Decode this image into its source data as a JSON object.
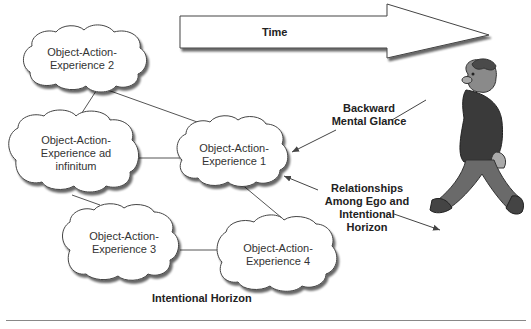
{
  "diagram": {
    "time_arrow": {
      "label": "Time"
    },
    "clouds": [
      {
        "id": "oae2",
        "line1": "Object-Action-",
        "line2": "Experience 2"
      },
      {
        "id": "oae-inf",
        "line1": "Object-Action-",
        "line2": "Experience ad",
        "line3": "infinitum"
      },
      {
        "id": "oae1",
        "line1": "Object-Action-",
        "line2": "Experience 1"
      },
      {
        "id": "oae3",
        "line1": "Object-Action-",
        "line2": "Experience 3"
      },
      {
        "id": "oae4",
        "line1": "Object-Action-",
        "line2": "Experience 4"
      }
    ],
    "annotations": {
      "backward_glance": {
        "line1": "Backward",
        "line2": "Mental Glance"
      },
      "relationships": {
        "line1": "Relationships",
        "line2": "Among Ego and",
        "line3": "Intentional",
        "line4": "Horizon"
      },
      "horizon": "Intentional Horizon"
    },
    "figure": {
      "character": "walking-man-illustration"
    },
    "colors": {
      "line": "#555555",
      "cloud_fill": "#ffffff",
      "cloud_shadow": "#666666",
      "character_shirt": "#3a3a3a",
      "character_pants": "#6a6a6a"
    }
  }
}
